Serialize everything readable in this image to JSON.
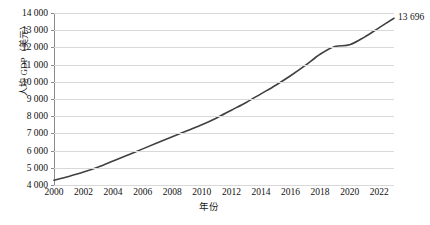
{
  "chart_data": {
    "type": "line",
    "title": "",
    "xlabel": "年份",
    "ylabel": "人均 GDP（美元）",
    "x": [
      2000,
      2001,
      2002,
      2003,
      2004,
      2005,
      2006,
      2007,
      2008,
      2009,
      2010,
      2011,
      2012,
      2013,
      2014,
      2015,
      2016,
      2017,
      2018,
      2019,
      2020,
      2021,
      2022,
      2023
    ],
    "values": [
      4280,
      4500,
      4750,
      5050,
      5400,
      5750,
      6100,
      6450,
      6800,
      7150,
      7500,
      7900,
      8350,
      8800,
      9300,
      9800,
      10350,
      10950,
      11600,
      12050,
      12150,
      12600,
      13150,
      13696
    ],
    "series": [
      {
        "name": "人均 GDP（美元）",
        "values": [
          4280,
          4500,
          4750,
          5050,
          5400,
          5750,
          6100,
          6450,
          6800,
          7150,
          7500,
          7900,
          8350,
          8800,
          9300,
          9800,
          10350,
          10950,
          11600,
          12050,
          12150,
          12600,
          13150,
          13696
        ]
      }
    ],
    "xlim": [
      2000,
      2023
    ],
    "ylim": [
      4000,
      14000
    ],
    "x_tick_labels": [
      "2000",
      "2002",
      "2004",
      "2006",
      "2008",
      "2010",
      "2012",
      "2014",
      "2016",
      "2018",
      "2020",
      "2022"
    ],
    "x_tick_values": [
      2000,
      2002,
      2004,
      2006,
      2008,
      2010,
      2012,
      2014,
      2016,
      2018,
      2020,
      2022
    ],
    "y_tick_labels": [
      "14 000",
      "13 000",
      "12 000",
      "11 000",
      "10 000",
      "9 000",
      "8 000",
      "7 000",
      "6 000",
      "5 000",
      "4 000"
    ],
    "y_tick_values": [
      14000,
      13000,
      12000,
      11000,
      10000,
      9000,
      8000,
      7000,
      6000,
      5000,
      4000
    ],
    "grid": true,
    "legend": "none",
    "annotations": [
      {
        "text": "13 696",
        "x": 2023,
        "y": 13696
      }
    ],
    "line_color": "#404040",
    "grid_color": "#d9d9d9",
    "axis_color": "#8a8a8a",
    "background": "#ffffff"
  }
}
